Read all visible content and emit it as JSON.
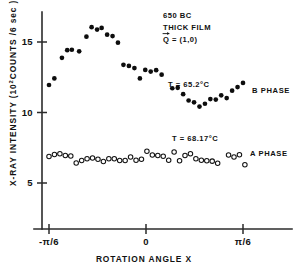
{
  "figure": {
    "background": "#ffffff",
    "ink_color": "#111111"
  },
  "chart_data": {
    "type": "scatter",
    "title": "",
    "xlabel": "ROTATION ANGLE X",
    "ylabel": "X-RAY INTENSITY (10² COUNTS / 6 sec)",
    "ylabel_parts": {
      "prefix": "X-RAY INTENSITY (10",
      "exponent": "2",
      "suffix": "COUNTS /6 sec )"
    },
    "xlim": [
      -0.6981,
      0.6981
    ],
    "ylim": [
      3.0,
      16.6
    ],
    "grid": false,
    "legend_position": "right-inline",
    "xticks": [
      -0.5236,
      0.0,
      0.5236
    ],
    "xticklabels": [
      "-π/6",
      "0",
      "π/6"
    ],
    "yticks": [
      5,
      10,
      15
    ],
    "yticklabels": [
      "5",
      "10",
      "15"
    ],
    "annotations": [
      {
        "name": "sample-id",
        "text": "650 BC"
      },
      {
        "name": "sample-type",
        "text": "THICK FILM"
      },
      {
        "name": "scattering-vector",
        "text": "Q = (1,0)",
        "prefix": "Q",
        "suffix": "= (1,0)",
        "accent": "vector-arrow"
      },
      {
        "name": "temperature-b-phase",
        "text": "T = 65.2°C"
      },
      {
        "name": "temperature-a-phase",
        "text": "T = 68.17°C"
      }
    ],
    "series": [
      {
        "name": "B PHASE",
        "label": "B PHASE",
        "temperature": "T = 65.2°C",
        "marker": "filled-circle",
        "color": "#0d0d0d",
        "points": [
          [
            -0.5236,
            11.95
          ],
          [
            -0.4947,
            12.42
          ],
          [
            -0.4538,
            13.88
          ],
          [
            -0.4253,
            14.42
          ],
          [
            -0.4003,
            14.45
          ],
          [
            -0.3608,
            14.34
          ],
          [
            -0.3216,
            15.38
          ],
          [
            -0.2936,
            16.05
          ],
          [
            -0.264,
            15.88
          ],
          [
            -0.2395,
            16.0
          ],
          [
            -0.2098,
            15.52
          ],
          [
            -0.1805,
            15.42
          ],
          [
            -0.1514,
            14.95
          ],
          [
            -0.1218,
            13.38
          ],
          [
            -0.0923,
            13.3
          ],
          [
            -0.0625,
            13.15
          ],
          [
            -0.033,
            12.42
          ],
          [
            -0.004,
            13.02
          ],
          [
            0.0254,
            12.9
          ],
          [
            0.0549,
            13.0
          ],
          [
            0.0845,
            12.68
          ],
          [
            0.142,
            11.72
          ],
          [
            0.1712,
            11.75
          ],
          [
            0.2006,
            11.3
          ],
          [
            0.23,
            10.85
          ],
          [
            0.2593,
            10.72
          ],
          [
            0.2887,
            10.42
          ],
          [
            0.3181,
            10.62
          ],
          [
            0.3473,
            10.95
          ],
          [
            0.3767,
            10.92
          ],
          [
            0.406,
            11.22
          ],
          [
            0.4355,
            11.02
          ],
          [
            0.4648,
            11.55
          ],
          [
            0.4942,
            11.8
          ],
          [
            0.5236,
            12.1
          ]
        ]
      },
      {
        "name": "A PHASE",
        "label": "A PHASE",
        "temperature": "T = 68.17°C",
        "marker": "open-circle",
        "color": "#131313",
        "points": [
          [
            -0.5236,
            6.88
          ],
          [
            -0.4942,
            7.02
          ],
          [
            -0.4648,
            7.08
          ],
          [
            -0.4355,
            6.95
          ],
          [
            -0.406,
            6.92
          ],
          [
            -0.3767,
            6.42
          ],
          [
            -0.3473,
            6.6
          ],
          [
            -0.3181,
            6.72
          ],
          [
            -0.2887,
            6.78
          ],
          [
            -0.2593,
            6.68
          ],
          [
            -0.23,
            6.52
          ],
          [
            -0.2006,
            6.72
          ],
          [
            -0.1712,
            6.72
          ],
          [
            -0.142,
            6.6
          ],
          [
            -0.1126,
            6.6
          ],
          [
            -0.0832,
            6.85
          ],
          [
            -0.0538,
            6.62
          ],
          [
            -0.0245,
            6.68
          ],
          [
            0.0049,
            7.25
          ],
          [
            0.0343,
            6.98
          ],
          [
            0.0637,
            6.95
          ],
          [
            0.093,
            6.9
          ],
          [
            0.1224,
            6.62
          ],
          [
            0.1518,
            7.2
          ],
          [
            0.1812,
            6.58
          ],
          [
            0.2105,
            6.95
          ],
          [
            0.2399,
            7.08
          ],
          [
            0.2693,
            6.72
          ],
          [
            0.2987,
            6.62
          ],
          [
            0.3281,
            6.58
          ],
          [
            0.3574,
            6.55
          ],
          [
            0.3868,
            6.4
          ],
          [
            0.4456,
            6.98
          ],
          [
            0.475,
            6.85
          ],
          [
            0.5044,
            7.0
          ],
          [
            0.5338,
            6.3
          ]
        ]
      }
    ]
  }
}
